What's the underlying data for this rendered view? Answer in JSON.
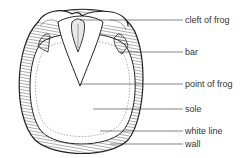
{
  "diagram": {
    "colors": {
      "ink": "#222222",
      "label": "#333333",
      "background": "#ffffff"
    },
    "labels": [
      {
        "id": "cleft-of-frog",
        "text": "cleft of frog",
        "y": 20
      },
      {
        "id": "bar",
        "text": "bar",
        "y": 52
      },
      {
        "id": "point-of-frog",
        "text": "point of frog",
        "y": 84
      },
      {
        "id": "sole",
        "text": "sole",
        "y": 109
      },
      {
        "id": "white-line",
        "text": "white line",
        "y": 131
      },
      {
        "id": "wall",
        "text": "wall",
        "y": 144
      }
    ]
  }
}
